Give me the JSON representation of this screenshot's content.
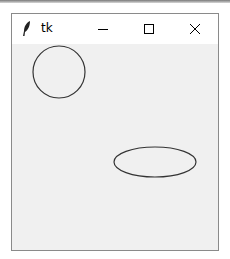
{
  "window": {
    "title": "tk",
    "controls": {
      "minimize": "minimize",
      "maximize": "maximize",
      "close": "close"
    }
  },
  "canvas": {
    "background": "#f0f0f0",
    "shapes": [
      {
        "type": "circle",
        "name": "circle",
        "cx": 47,
        "cy": 28,
        "rx": 26,
        "ry": 26,
        "stroke": "#333333",
        "fill": "none"
      },
      {
        "type": "ellipse",
        "name": "ellipse",
        "cx": 143,
        "cy": 118,
        "rx": 41,
        "ry": 15,
        "stroke": "#333333",
        "fill": "none"
      }
    ]
  },
  "colors": {
    "titlebar": "#ffffff",
    "border": "#8a8a8a",
    "canvas": "#f0f0f0",
    "stroke": "#333333"
  }
}
